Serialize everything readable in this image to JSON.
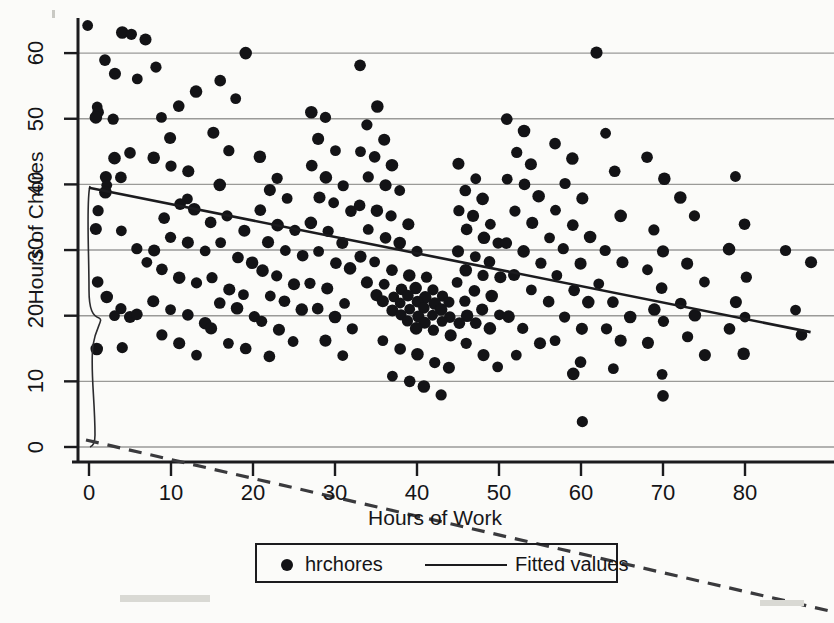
{
  "chart_data": {
    "type": "scatter",
    "title": "",
    "xlabel": "Hours of Work",
    "ylabel": "Hours of Chores",
    "xlim": [
      -2,
      90
    ],
    "ylim": [
      -2,
      67
    ],
    "xticks": [
      0,
      10,
      20,
      30,
      40,
      50,
      60,
      70,
      80
    ],
    "xtick_labels": [
      "0",
      "10",
      "20",
      "30",
      "40",
      "50",
      "60",
      "70",
      "80"
    ],
    "yticks": [
      0,
      10,
      20,
      30,
      40,
      50,
      60
    ],
    "ytick_labels": [
      "0",
      "10",
      "20",
      "30",
      "40",
      "50",
      "60"
    ],
    "grid": "horizontal",
    "legend_position": "below-axis",
    "series": [
      {
        "name": "hrchores",
        "marker": "filled-circle",
        "color": "#131316",
        "points": [
          [
            0,
            64
          ],
          [
            2,
            59
          ],
          [
            4,
            63
          ],
          [
            5,
            63
          ],
          [
            7,
            62
          ],
          [
            1,
            52
          ],
          [
            1,
            51
          ],
          [
            1,
            50
          ],
          [
            3,
            50
          ],
          [
            2,
            41
          ],
          [
            2,
            40
          ],
          [
            4,
            41
          ],
          [
            2,
            39
          ],
          [
            1,
            36
          ],
          [
            1,
            33
          ],
          [
            4,
            33
          ],
          [
            1,
            25
          ],
          [
            2,
            23
          ],
          [
            4,
            21
          ],
          [
            5,
            20
          ],
          [
            3,
            20
          ],
          [
            6,
            20
          ],
          [
            1,
            15
          ],
          [
            4,
            15
          ],
          [
            3,
            57
          ],
          [
            6,
            56
          ],
          [
            5,
            45
          ],
          [
            3,
            44
          ],
          [
            6,
            30
          ],
          [
            8,
            30
          ],
          [
            7,
            28
          ],
          [
            9,
            35
          ],
          [
            8,
            44
          ],
          [
            10,
            43
          ],
          [
            12,
            42
          ],
          [
            9,
            50
          ],
          [
            11,
            52
          ],
          [
            13,
            54
          ],
          [
            8,
            58
          ],
          [
            10,
            47
          ],
          [
            12,
            38
          ],
          [
            11,
            37
          ],
          [
            13,
            36
          ],
          [
            10,
            32
          ],
          [
            12,
            31
          ],
          [
            14,
            30
          ],
          [
            9,
            27
          ],
          [
            11,
            26
          ],
          [
            13,
            25
          ],
          [
            8,
            22
          ],
          [
            10,
            21
          ],
          [
            12,
            20
          ],
          [
            14,
            19
          ],
          [
            9,
            17
          ],
          [
            11,
            16
          ],
          [
            13,
            14
          ],
          [
            15,
            34
          ],
          [
            16,
            40
          ],
          [
            17,
            45
          ],
          [
            15,
            48
          ],
          [
            18,
            53
          ],
          [
            16,
            56
          ],
          [
            19,
            60
          ],
          [
            17,
            35
          ],
          [
            19,
            33
          ],
          [
            16,
            31
          ],
          [
            18,
            29
          ],
          [
            20,
            28
          ],
          [
            15,
            26
          ],
          [
            17,
            24
          ],
          [
            19,
            23
          ],
          [
            16,
            22
          ],
          [
            18,
            21
          ],
          [
            20,
            20
          ],
          [
            15,
            18
          ],
          [
            17,
            16
          ],
          [
            19,
            15
          ],
          [
            21,
            44
          ],
          [
            23,
            41
          ],
          [
            22,
            39
          ],
          [
            24,
            38
          ],
          [
            21,
            36
          ],
          [
            23,
            34
          ],
          [
            25,
            33
          ],
          [
            22,
            31
          ],
          [
            24,
            30
          ],
          [
            26,
            29
          ],
          [
            21,
            27
          ],
          [
            23,
            26
          ],
          [
            25,
            25
          ],
          [
            22,
            23
          ],
          [
            24,
            22
          ],
          [
            26,
            21
          ],
          [
            21,
            19
          ],
          [
            23,
            18
          ],
          [
            25,
            16
          ],
          [
            22,
            14
          ],
          [
            27,
            51
          ],
          [
            29,
            50
          ],
          [
            28,
            47
          ],
          [
            30,
            45
          ],
          [
            27,
            43
          ],
          [
            29,
            41
          ],
          [
            31,
            40
          ],
          [
            28,
            38
          ],
          [
            30,
            37
          ],
          [
            32,
            36
          ],
          [
            27,
            34
          ],
          [
            29,
            33
          ],
          [
            31,
            31
          ],
          [
            28,
            30
          ],
          [
            30,
            28
          ],
          [
            32,
            27
          ],
          [
            27,
            25
          ],
          [
            29,
            24
          ],
          [
            31,
            22
          ],
          [
            28,
            21
          ],
          [
            30,
            20
          ],
          [
            32,
            18
          ],
          [
            29,
            16
          ],
          [
            31,
            14
          ],
          [
            33,
            58
          ],
          [
            35,
            52
          ],
          [
            34,
            49
          ],
          [
            36,
            47
          ],
          [
            33,
            45
          ],
          [
            35,
            44
          ],
          [
            37,
            43
          ],
          [
            34,
            41
          ],
          [
            36,
            40
          ],
          [
            38,
            39
          ],
          [
            33,
            37
          ],
          [
            35,
            36
          ],
          [
            37,
            35
          ],
          [
            39,
            34
          ],
          [
            34,
            33
          ],
          [
            36,
            32
          ],
          [
            38,
            31
          ],
          [
            40,
            30
          ],
          [
            33,
            29
          ],
          [
            35,
            28
          ],
          [
            37,
            27
          ],
          [
            39,
            26
          ],
          [
            41,
            26
          ],
          [
            34,
            25
          ],
          [
            36,
            25
          ],
          [
            38,
            24
          ],
          [
            40,
            24
          ],
          [
            42,
            24
          ],
          [
            35,
            23
          ],
          [
            37,
            23
          ],
          [
            39,
            23
          ],
          [
            41,
            23
          ],
          [
            43,
            23
          ],
          [
            36,
            22
          ],
          [
            38,
            22
          ],
          [
            40,
            22
          ],
          [
            42,
            22
          ],
          [
            44,
            22
          ],
          [
            37,
            21
          ],
          [
            39,
            21
          ],
          [
            41,
            21
          ],
          [
            43,
            21
          ],
          [
            38,
            20
          ],
          [
            40,
            20
          ],
          [
            42,
            20
          ],
          [
            44,
            20
          ],
          [
            46,
            20
          ],
          [
            39,
            19
          ],
          [
            41,
            19
          ],
          [
            43,
            19
          ],
          [
            45,
            19
          ],
          [
            40,
            18
          ],
          [
            42,
            18
          ],
          [
            44,
            17
          ],
          [
            36,
            16
          ],
          [
            38,
            15
          ],
          [
            40,
            14
          ],
          [
            42,
            13
          ],
          [
            44,
            12
          ],
          [
            37,
            11
          ],
          [
            39,
            10
          ],
          [
            41,
            9
          ],
          [
            43,
            8
          ],
          [
            45,
            43
          ],
          [
            47,
            41
          ],
          [
            46,
            39
          ],
          [
            48,
            38
          ],
          [
            45,
            36
          ],
          [
            47,
            35
          ],
          [
            49,
            34
          ],
          [
            46,
            33
          ],
          [
            48,
            32
          ],
          [
            50,
            31
          ],
          [
            45,
            30
          ],
          [
            47,
            29
          ],
          [
            49,
            28
          ],
          [
            46,
            27
          ],
          [
            48,
            26
          ],
          [
            50,
            26
          ],
          [
            45,
            25
          ],
          [
            47,
            24
          ],
          [
            49,
            23
          ],
          [
            46,
            22
          ],
          [
            48,
            21
          ],
          [
            50,
            20
          ],
          [
            47,
            19
          ],
          [
            49,
            18
          ],
          [
            46,
            16
          ],
          [
            48,
            14
          ],
          [
            50,
            12
          ],
          [
            51,
            50
          ],
          [
            53,
            48
          ],
          [
            52,
            45
          ],
          [
            54,
            43
          ],
          [
            51,
            41
          ],
          [
            53,
            40
          ],
          [
            55,
            38
          ],
          [
            52,
            36
          ],
          [
            54,
            34
          ],
          [
            56,
            32
          ],
          [
            51,
            31
          ],
          [
            53,
            30
          ],
          [
            55,
            28
          ],
          [
            52,
            26
          ],
          [
            54,
            24
          ],
          [
            56,
            22
          ],
          [
            51,
            20
          ],
          [
            53,
            18
          ],
          [
            55,
            16
          ],
          [
            52,
            14
          ],
          [
            57,
            46
          ],
          [
            59,
            44
          ],
          [
            58,
            40
          ],
          [
            60,
            38
          ],
          [
            57,
            36
          ],
          [
            59,
            34
          ],
          [
            61,
            32
          ],
          [
            58,
            30
          ],
          [
            60,
            28
          ],
          [
            57,
            26
          ],
          [
            59,
            24
          ],
          [
            61,
            22
          ],
          [
            58,
            20
          ],
          [
            60,
            18
          ],
          [
            57,
            16
          ],
          [
            60,
            13
          ],
          [
            59,
            11
          ],
          [
            60,
            4
          ],
          [
            62,
            60
          ],
          [
            63,
            48
          ],
          [
            64,
            42
          ],
          [
            65,
            35
          ],
          [
            63,
            30
          ],
          [
            65,
            28
          ],
          [
            62,
            25
          ],
          [
            64,
            22
          ],
          [
            66,
            20
          ],
          [
            63,
            18
          ],
          [
            65,
            16
          ],
          [
            64,
            12
          ],
          [
            68,
            44
          ],
          [
            70,
            41
          ],
          [
            69,
            33
          ],
          [
            70,
            30
          ],
          [
            68,
            27
          ],
          [
            70,
            24
          ],
          [
            69,
            21
          ],
          [
            70,
            19
          ],
          [
            68,
            16
          ],
          [
            70,
            11
          ],
          [
            70,
            8
          ],
          [
            72,
            38
          ],
          [
            74,
            35
          ],
          [
            73,
            28
          ],
          [
            75,
            25
          ],
          [
            72,
            22
          ],
          [
            74,
            20
          ],
          [
            73,
            17
          ],
          [
            75,
            14
          ],
          [
            79,
            41
          ],
          [
            80,
            34
          ],
          [
            78,
            30
          ],
          [
            80,
            26
          ],
          [
            79,
            22
          ],
          [
            80,
            20
          ],
          [
            78,
            18
          ],
          [
            80,
            14
          ],
          [
            85,
            30
          ],
          [
            88,
            28
          ],
          [
            86,
            21
          ],
          [
            87,
            17
          ]
        ]
      }
    ],
    "fit_line": {
      "name": "Fitted values",
      "color": "#1b1b1e",
      "x_start": 0,
      "y_start": 39.5,
      "x_end": 88,
      "y_end": 17.5
    }
  },
  "artifacts": {
    "note": "scan artifacts: curved line near y-axis and dashed diagonal fold line"
  }
}
